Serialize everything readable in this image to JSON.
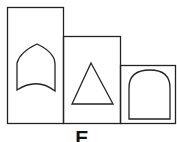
{
  "figure": {
    "option_label": "E",
    "stroke_color": "#222222",
    "background": "#ffffff",
    "panels": [
      {
        "name": "tall-panel",
        "shape": "pointed-arch-with-concave-base"
      },
      {
        "name": "middle-panel",
        "shape": "triangle"
      },
      {
        "name": "short-panel",
        "shape": "rounded-arch"
      }
    ]
  }
}
